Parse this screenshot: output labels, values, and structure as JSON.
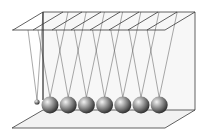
{
  "figure": {
    "ball_count": 7,
    "extra_small_ball": true,
    "colors": {
      "background": "#ffffff",
      "frame_line": "#3a3a3a",
      "panel_fill": "#f4f4f4",
      "string": "#555555",
      "ball_highlight": "#f2f2f2",
      "ball_mid": "#9a9a9a",
      "ball_dark": "#2e2e2e"
    }
  }
}
